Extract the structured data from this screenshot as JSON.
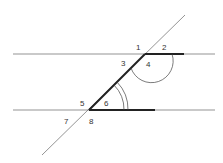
{
  "diagram": {
    "labels": [
      {
        "id": "1",
        "text": "1",
        "x": 136,
        "y": 50
      },
      {
        "id": "2",
        "text": "2",
        "x": 162,
        "y": 50
      },
      {
        "id": "3",
        "text": "3",
        "x": 121,
        "y": 66
      },
      {
        "id": "4",
        "text": "4",
        "x": 146,
        "y": 67
      },
      {
        "id": "5",
        "text": "5",
        "x": 80,
        "y": 106
      },
      {
        "id": "6",
        "text": "6",
        "x": 104,
        "y": 106
      },
      {
        "id": "7",
        "text": "7",
        "x": 64,
        "y": 124
      },
      {
        "id": "8",
        "text": "8",
        "x": 89,
        "y": 124
      }
    ],
    "colors": {
      "thin": "#555555",
      "thick": "#222222"
    }
  }
}
